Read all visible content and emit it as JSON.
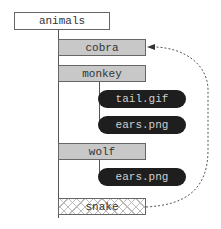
{
  "diagram": {
    "root": {
      "label": "animals"
    },
    "nodes": [
      {
        "label": "cobra",
        "kind": "folder"
      },
      {
        "label": "monkey",
        "kind": "folder"
      },
      {
        "label": "tail.gif",
        "kind": "file"
      },
      {
        "label": "ears.png",
        "kind": "file"
      },
      {
        "label": "wolf",
        "kind": "folder"
      },
      {
        "label": "ears.png",
        "kind": "file"
      },
      {
        "label": "snake",
        "kind": "hatched"
      }
    ],
    "link": {
      "from": "snake",
      "to": "cobra",
      "style": "dotted-arrow"
    }
  }
}
